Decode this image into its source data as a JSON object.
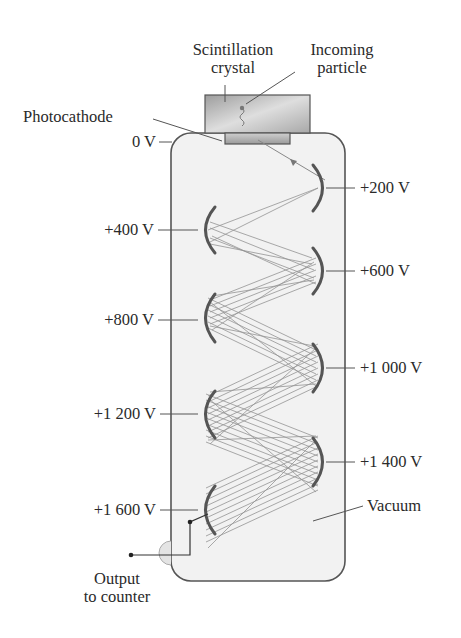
{
  "labels": {
    "scintillation_crystal": [
      "Scintillation",
      "crystal"
    ],
    "incoming_particle": [
      "Incoming",
      "particle"
    ],
    "photocathode": "Photocathode",
    "vacuum": "Vacuum",
    "output": [
      "Output",
      "to counter"
    ]
  },
  "dynodes": [
    {
      "voltage": "0 V",
      "side": "left"
    },
    {
      "voltage": "+200 V",
      "side": "right"
    },
    {
      "voltage": "+400 V",
      "side": "left"
    },
    {
      "voltage": "+600 V",
      "side": "right"
    },
    {
      "voltage": "+800 V",
      "side": "left"
    },
    {
      "voltage": "+1 000 V",
      "side": "right"
    },
    {
      "voltage": "+1 200 V",
      "side": "left"
    },
    {
      "voltage": "+1 400 V",
      "side": "right"
    },
    {
      "voltage": "+1 600 V",
      "side": "left"
    }
  ],
  "colors": {
    "tube_fill": "#f2f2f2",
    "tube_stroke": "#555555",
    "dynode": "#555555",
    "electron_paths": "#8a8a8a",
    "crystal": "#b8b8b8",
    "text": "#2a2a2a"
  }
}
